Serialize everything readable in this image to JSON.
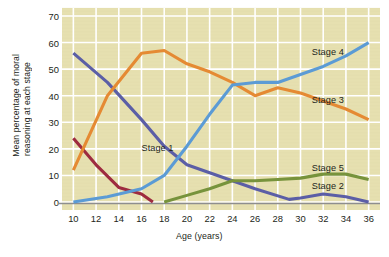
{
  "chart_data": {
    "type": "line",
    "title": "",
    "xlabel": "Age (years)",
    "ylabel": "Mean percentage of moral reasoning at each stage",
    "ylabel_line1": "Mean percentage of moral",
    "ylabel_line2": "reasoning at each stage",
    "xlim": [
      9,
      37
    ],
    "ylim": [
      -3,
      73
    ],
    "yticks": [
      0,
      10,
      20,
      30,
      40,
      50,
      60,
      70
    ],
    "xticks": [
      10,
      12,
      14,
      16,
      18,
      20,
      22,
      24,
      26,
      28,
      30,
      32,
      34,
      36
    ],
    "grid": true,
    "grid_color": "#ffffff",
    "plot_background": "#e6e0b0",
    "legend_position": "inline-labels",
    "series": [
      {
        "name": "Stage 1",
        "color": "#9e2b3f",
        "label_x": 16,
        "label_y": 20,
        "x": [
          10,
          12,
          14,
          16,
          17
        ],
        "values": [
          24,
          14,
          5.5,
          3,
          0
        ]
      },
      {
        "name": "Stage 2",
        "color": "#5b5ea6",
        "label_x": 31,
        "label_y": 5.5,
        "x": [
          10,
          13,
          16,
          18,
          20,
          22,
          24,
          26,
          29,
          30,
          32,
          34,
          36
        ],
        "values": [
          56,
          45,
          31,
          21,
          14,
          11,
          8,
          5,
          1,
          1.5,
          3,
          2,
          0
        ]
      },
      {
        "name": "Stage 3",
        "color": "#e58a33",
        "label_x": 31,
        "label_y": 38,
        "x": [
          10,
          13,
          16,
          18,
          20,
          22,
          24,
          26,
          28,
          30,
          32,
          34,
          36
        ],
        "values": [
          12,
          40,
          56,
          57,
          52,
          49,
          45,
          40,
          43,
          41,
          38,
          35,
          31
        ]
      },
      {
        "name": "Stage 4",
        "color": "#5b9bd5",
        "label_x": 31,
        "label_y": 56,
        "x": [
          10,
          13,
          16,
          18,
          20,
          22,
          24,
          26,
          28,
          30,
          32,
          34,
          36
        ],
        "values": [
          0,
          2,
          5,
          10,
          21,
          33,
          44,
          45,
          45,
          48,
          51,
          55,
          60
        ]
      },
      {
        "name": "Stage 5",
        "color": "#77933c",
        "label_x": 31,
        "label_y": 12.5,
        "x": [
          18,
          20,
          22,
          24,
          26,
          28,
          30,
          32,
          34,
          36
        ],
        "values": [
          0,
          2.5,
          5,
          8,
          8,
          8.5,
          9,
          10.5,
          10.5,
          8.5
        ]
      }
    ]
  }
}
